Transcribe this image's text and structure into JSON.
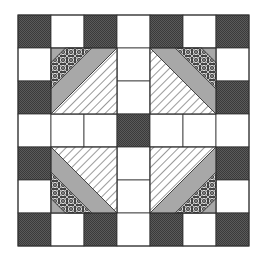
{
  "quilt": {
    "name": "Quilt block pattern",
    "grid": {
      "origin_x": 18,
      "origin_y": 15,
      "cell": 33,
      "rows": 7,
      "cols": 7
    },
    "colors": {
      "background": "#ffffff",
      "dark": "#5a5a5a",
      "dark_dot": "#3a3a3a",
      "gray": "#a8a8a8",
      "outline": "#333333",
      "hatch": "#555555",
      "print_bg": "#444444",
      "print_fg": "#e6e6e6"
    },
    "squares": [
      {
        "r": 0,
        "c": 0,
        "fill": "dark"
      },
      {
        "r": 0,
        "c": 1,
        "fill": "white"
      },
      {
        "r": 0,
        "c": 2,
        "fill": "dark"
      },
      {
        "r": 0,
        "c": 3,
        "fill": "white"
      },
      {
        "r": 0,
        "c": 4,
        "fill": "dark"
      },
      {
        "r": 0,
        "c": 5,
        "fill": "white"
      },
      {
        "r": 0,
        "c": 6,
        "fill": "dark"
      },
      {
        "r": 1,
        "c": 0,
        "fill": "white"
      },
      {
        "r": 1,
        "c": 3,
        "fill": "white"
      },
      {
        "r": 1,
        "c": 6,
        "fill": "white"
      },
      {
        "r": 2,
        "c": 0,
        "fill": "dark"
      },
      {
        "r": 2,
        "c": 3,
        "fill": "white"
      },
      {
        "r": 2,
        "c": 6,
        "fill": "dark"
      },
      {
        "r": 3,
        "c": 0,
        "fill": "white"
      },
      {
        "r": 3,
        "c": 1,
        "fill": "white"
      },
      {
        "r": 3,
        "c": 2,
        "fill": "white"
      },
      {
        "r": 3,
        "c": 3,
        "fill": "dark"
      },
      {
        "r": 3,
        "c": 4,
        "fill": "white"
      },
      {
        "r": 3,
        "c": 5,
        "fill": "white"
      },
      {
        "r": 3,
        "c": 6,
        "fill": "white"
      },
      {
        "r": 4,
        "c": 0,
        "fill": "dark"
      },
      {
        "r": 4,
        "c": 3,
        "fill": "white"
      },
      {
        "r": 4,
        "c": 6,
        "fill": "dark"
      },
      {
        "r": 5,
        "c": 0,
        "fill": "white"
      },
      {
        "r": 5,
        "c": 3,
        "fill": "white"
      },
      {
        "r": 5,
        "c": 6,
        "fill": "white"
      },
      {
        "r": 6,
        "c": 0,
        "fill": "dark"
      },
      {
        "r": 6,
        "c": 1,
        "fill": "white"
      },
      {
        "r": 6,
        "c": 2,
        "fill": "dark"
      },
      {
        "r": 6,
        "c": 3,
        "fill": "white"
      },
      {
        "r": 6,
        "c": 4,
        "fill": "dark"
      },
      {
        "r": 6,
        "c": 5,
        "fill": "white"
      },
      {
        "r": 6,
        "c": 6,
        "fill": "dark"
      }
    ],
    "diagonal_blocks": [
      {
        "id": "top-left",
        "r": 1,
        "c": 1,
        "corner": "top-left"
      },
      {
        "id": "top-right",
        "r": 1,
        "c": 4,
        "corner": "top-right"
      },
      {
        "id": "bottom-left",
        "r": 4,
        "c": 1,
        "corner": "bottom-left"
      },
      {
        "id": "bottom-right",
        "r": 4,
        "c": 4,
        "corner": "bottom-right"
      }
    ]
  }
}
